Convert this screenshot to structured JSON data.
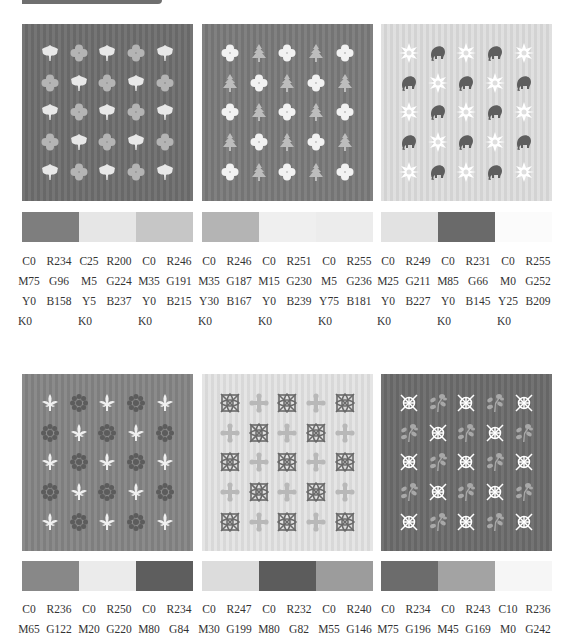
{
  "header": {
    "label": ""
  },
  "colors": {
    "panel1_bg": "#6e6e6e",
    "panel1_a": "#e8e8e8",
    "panel1_b": "#b4b4b4",
    "panel2_bg": "#7a7a7a",
    "panel2_a": "#f2f2f2",
    "panel2_b": "#bdbdbd",
    "panel3_bg": "#dedede",
    "panel3_a": "#ffffff",
    "panel3_b": "#5e5e5e",
    "panel4_bg": "#858585",
    "panel4_a": "#f0f0f0",
    "panel4_b": "#5c5c5c",
    "panel5_bg": "#e4e4e4",
    "panel5_a": "#6a6a6a",
    "panel5_b": "#b8b8b8",
    "panel6_bg": "#6b6b6b",
    "panel6_a": "#ffffff",
    "panel6_b": "#a8a8a8"
  },
  "groups": [
    {
      "motifs": [
        "leaf-icon",
        "clover-icon"
      ],
      "swatches": [
        "#7e7e7e",
        "#e6e6e6",
        "#c6c6c6"
      ],
      "codes": [
        {
          "cmyk": [
            "C0",
            "M75",
            "Y0",
            "K0"
          ],
          "rgb": [
            "R234",
            "G96",
            "B158"
          ]
        },
        {
          "cmyk": [
            "C25",
            "M5",
            "Y5",
            "K0"
          ],
          "rgb": [
            "R200",
            "G224",
            "B237"
          ]
        },
        {
          "cmyk": [
            "C0",
            "M35",
            "Y0",
            "K0"
          ],
          "rgb": [
            "R246",
            "G191",
            "B215"
          ]
        }
      ]
    },
    {
      "motifs": [
        "clover-icon",
        "pine-tree-icon"
      ],
      "swatches": [
        "#b4b4b4",
        "#efefef",
        "#ececec"
      ],
      "codes": [
        {
          "cmyk": [
            "C0",
            "M35",
            "Y30",
            "K0"
          ],
          "rgb": [
            "R246",
            "G187",
            "B167"
          ]
        },
        {
          "cmyk": [
            "C0",
            "M15",
            "Y0",
            "K0"
          ],
          "rgb": [
            "R251",
            "G230",
            "B239"
          ]
        },
        {
          "cmyk": [
            "C0",
            "M5",
            "Y75",
            "K0"
          ],
          "rgb": [
            "R255",
            "G236",
            "B181"
          ]
        }
      ]
    },
    {
      "motifs": [
        "medallion-icon",
        "elephant-icon"
      ],
      "swatches": [
        "#e2e2e2",
        "#6a6a6a",
        "#fbfbfb"
      ],
      "codes": [
        {
          "cmyk": [
            "C0",
            "M25",
            "Y0",
            "K0"
          ],
          "rgb": [
            "R249",
            "G211",
            "B227"
          ]
        },
        {
          "cmyk": [
            "C0",
            "M85",
            "Y0",
            "K0"
          ],
          "rgb": [
            "R231",
            "G66",
            "B145"
          ]
        },
        {
          "cmyk": [
            "C0",
            "M0",
            "Y25",
            "K0"
          ],
          "rgb": [
            "R255",
            "G252",
            "B209"
          ]
        }
      ]
    },
    {
      "motifs": [
        "fleur-de-lis-icon",
        "rosette-icon"
      ],
      "swatches": [
        "#888888",
        "#ebebeb",
        "#5e5e5e"
      ],
      "codes": [
        {
          "cmyk": [
            "C0",
            "M65"
          ],
          "rgb": [
            "R236",
            "G122"
          ]
        },
        {
          "cmyk": [
            "C0",
            "M20"
          ],
          "rgb": [
            "R250",
            "G220"
          ]
        },
        {
          "cmyk": [
            "C0",
            "M80"
          ],
          "rgb": [
            "R234",
            "G84"
          ]
        }
      ]
    },
    {
      "motifs": [
        "ornate-square-icon",
        "cross-icon"
      ],
      "swatches": [
        "#dcdcdc",
        "#5c5c5c",
        "#9c9c9c"
      ],
      "codes": [
        {
          "cmyk": [
            "C0",
            "M30"
          ],
          "rgb": [
            "R247",
            "G199"
          ]
        },
        {
          "cmyk": [
            "C0",
            "M80"
          ],
          "rgb": [
            "R232",
            "G82"
          ]
        },
        {
          "cmyk": [
            "C0",
            "M55"
          ],
          "rgb": [
            "R240",
            "G146"
          ]
        }
      ]
    },
    {
      "motifs": [
        "target-cross-icon",
        "sprig-icon"
      ],
      "swatches": [
        "#6c6c6c",
        "#a3a3a3",
        "#f6f6f6"
      ],
      "codes": [
        {
          "cmyk": [
            "C0",
            "M75"
          ],
          "rgb": [
            "R234",
            "G196"
          ]
        },
        {
          "cmyk": [
            "C0",
            "M45"
          ],
          "rgb": [
            "R243",
            "G169"
          ]
        },
        {
          "cmyk": [
            "C10",
            "M0"
          ],
          "rgb": [
            "R236",
            "G242"
          ]
        }
      ]
    }
  ]
}
